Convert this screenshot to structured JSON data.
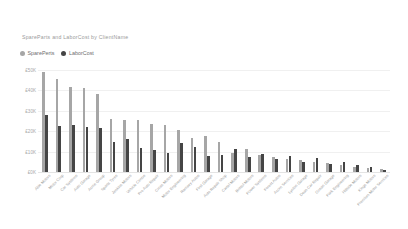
{
  "chart": {
    "title": "SpareParts and LaborCost by ClientName"
  },
  "legend": {
    "position": "top-left",
    "items": [
      {
        "label": "SparePerts",
        "color": "#a6a6a6",
        "icon": "legend-dot-icon"
      },
      {
        "label": "LaborCost",
        "color": "#454545",
        "icon": "legend-dot-icon"
      }
    ]
  },
  "chart_data": {
    "type": "bar",
    "title": "SpareParts and LaborCost by ClientName",
    "xlabel": "",
    "ylabel": "",
    "ylim": [
      0,
      50000
    ],
    "grid": true,
    "y_ticks": [
      0,
      10000,
      20000,
      30000,
      40000,
      50000
    ],
    "y_tick_labels": [
      "£0K",
      "£10K",
      "£20K",
      "£30K",
      "£40K",
      "£50K"
    ],
    "legend_position": "top-left",
    "categories": [
      "Able Motors",
      "Motor Corp",
      "Car Systems",
      "Auto Garage",
      "Acme Group",
      "Sparts Tyres",
      "Jenkins Motors",
      "Vehicle Centre",
      "Pro Auto Repair",
      "Cross Motors",
      "Motor Engineering",
      "Ramsey Autos",
      "First Garage",
      "Auto Repair Shop",
      "Cartel Motors",
      "Bristol Motors",
      "Power Systems",
      "Forest Autos",
      "Acorn Services",
      "Lynton Garage",
      "Dean Car Repair",
      "Ocean Garage",
      "Park Engineering",
      "Hillside Motors",
      "Kings Motors",
      "Premium Motor Services"
    ],
    "series": [
      {
        "name": "SparePerts",
        "color": "#a6a6a6",
        "values": [
          49000,
          45500,
          41500,
          41000,
          38000,
          26000,
          25500,
          25500,
          23500,
          23000,
          20500,
          16500,
          17500,
          14500,
          9500,
          11500,
          8500,
          7500,
          6500,
          6000,
          5000,
          4500,
          3500,
          2500,
          2000,
          1500
        ]
      },
      {
        "name": "LaborCost",
        "color": "#454545",
        "values": [
          28000,
          22500,
          23000,
          22000,
          21500,
          14500,
          16000,
          12000,
          11000,
          9500,
          14000,
          12500,
          8000,
          8500,
          11500,
          7500,
          9000,
          6500,
          8000,
          5000,
          7000,
          4000,
          5000,
          3500,
          2500,
          1200
        ]
      }
    ]
  }
}
